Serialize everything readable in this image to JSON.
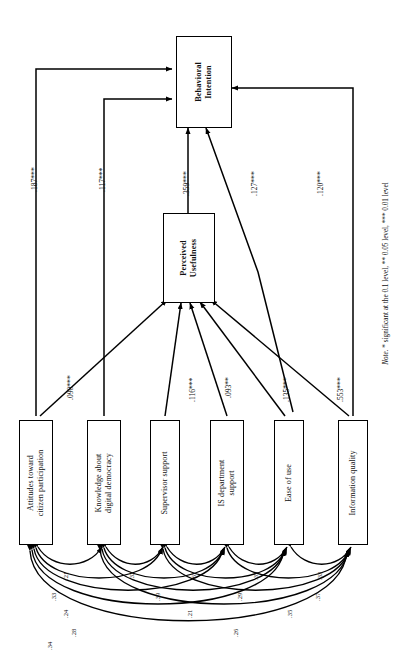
{
  "figure": {
    "type": "structural-equation-path-diagram",
    "orientation": "rotated-90-ccw",
    "note": "Note. * significant at the 0.1 level, ** 0.05 level, *** 0.01 level",
    "note_prefix": "Note.",
    "note_body": " * significant at the 0.1 level, ** 0.05 level, *** 0.01 level"
  },
  "nodes": {
    "behavioral_intention": "Behavioral\nIntention",
    "perceived_usefulness": "Perceived\nUsefulness",
    "attitudes": "Attitudes toward\ncitizen participation",
    "knowledge": "Knowledge about\ndigital democracy",
    "supervisor": "Supervisor support",
    "is_department": "IS department\nsupport",
    "ease_of_use": "Ease of use",
    "information_quality": "Information quality"
  },
  "paths": [
    {
      "id": "attitudes-to-bi",
      "from": "attitudes",
      "to": "behavioral_intention",
      "label": ".187***"
    },
    {
      "id": "knowledge-to-bi",
      "from": "knowledge",
      "to": "behavioral_intention",
      "label": ".117***"
    },
    {
      "id": "pu-to-bi",
      "from": "perceived_usefulness",
      "to": "behavioral_intention",
      "label": ".359***"
    },
    {
      "id": "easeofuse-to-bi",
      "from": "ease_of_use",
      "to": "behavioral_intention",
      "label": ".127***"
    },
    {
      "id": "infoquality-to-bi",
      "from": "information_quality",
      "to": "behavioral_intention",
      "label": ".120***"
    },
    {
      "id": "attitudes-to-pu",
      "from": "attitudes",
      "to": "perceived_usefulness",
      "label": ".090***"
    },
    {
      "id": "supervisor-to-pu",
      "from": "supervisor",
      "to": "perceived_usefulness",
      "label": ".116***"
    },
    {
      "id": "isdepartment-to-pu",
      "from": "is_department",
      "to": "perceived_usefulness",
      "label": ".093**"
    },
    {
      "id": "easeofuse-to-pu",
      "from": "ease_of_use",
      "to": "perceived_usefulness",
      "label": ".135***"
    },
    {
      "id": "infoquality-to-pu",
      "from": "information_quality",
      "to": "perceived_usefulness",
      "label": ".553***"
    }
  ],
  "correlations": [
    {
      "id": "corr-att-kno",
      "between": [
        "attitudes",
        "knowledge"
      ],
      "label": ".21"
    },
    {
      "id": "corr-kno-sup",
      "between": [
        "knowledge",
        "supervisor"
      ],
      "label": ".32"
    },
    {
      "id": "corr-sup-isd",
      "between": [
        "supervisor",
        "is_department"
      ],
      "label": ".67"
    },
    {
      "id": "corr-isd-eou",
      "between": [
        "is_department",
        "ease_of_use"
      ],
      "label": ".35"
    },
    {
      "id": "corr-eou-inf",
      "between": [
        "ease_of_use",
        "information_quality"
      ],
      "label": ".33"
    },
    {
      "id": "corr-att-sup",
      "between": [
        "attitudes",
        "supervisor"
      ],
      "label": ".33"
    },
    {
      "id": "corr-kno-isd",
      "between": [
        "knowledge",
        "is_department"
      ],
      "label": ".39"
    },
    {
      "id": "corr-sup-eou",
      "between": [
        "supervisor",
        "ease_of_use"
      ],
      "label": ".29"
    },
    {
      "id": "corr-isd-inf",
      "between": [
        "is_department",
        "information_quality"
      ],
      "label": ".37"
    },
    {
      "id": "corr-att-isd",
      "between": [
        "attitudes",
        "is_department"
      ],
      "label": ".24"
    },
    {
      "id": "corr-kno-eou",
      "between": [
        "knowledge",
        "ease_of_use"
      ],
      "label": ".21"
    },
    {
      "id": "corr-sup-inf",
      "between": [
        "supervisor",
        "information_quality"
      ],
      "label": ".35"
    },
    {
      "id": "corr-att-eou",
      "between": [
        "attitudes",
        "ease_of_use"
      ],
      "label": ".28"
    },
    {
      "id": "corr-kno-inf",
      "between": [
        "knowledge",
        "information_quality"
      ],
      "label": ".26"
    },
    {
      "id": "corr-att-inf",
      "between": [
        "attitudes",
        "information_quality"
      ],
      "label": ".34"
    }
  ]
}
